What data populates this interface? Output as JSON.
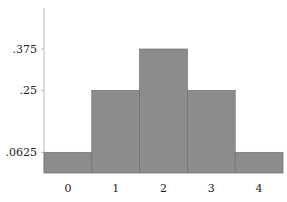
{
  "chart_data": {
    "type": "bar",
    "title": "",
    "xlabel": "",
    "ylabel": "",
    "categories": [
      "0",
      "1",
      "2",
      "3",
      "4"
    ],
    "values": [
      0.0625,
      0.25,
      0.375,
      0.25,
      0.0625
    ],
    "y_ticks": [
      ".0625",
      ".25",
      ".375"
    ],
    "y_tick_values": [
      0.0625,
      0.25,
      0.375
    ],
    "ylim": [
      0,
      0.5
    ],
    "grid": false,
    "legend": null,
    "bar_color": "#8c8c8c"
  }
}
